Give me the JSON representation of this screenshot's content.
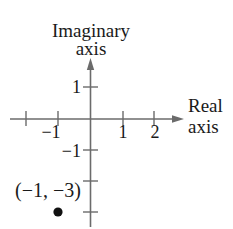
{
  "diagram": {
    "type": "complex-plane",
    "axes": {
      "imaginary_label_line1": "Imaginary",
      "imaginary_label_line2": "axis",
      "real_label_line1": "Real",
      "real_label_line2": "axis"
    },
    "x_ticks": [
      {
        "value": -2,
        "label": ""
      },
      {
        "value": -1,
        "label": "−1"
      },
      {
        "value": 1,
        "label": "1"
      },
      {
        "value": 2,
        "label": "2"
      }
    ],
    "y_ticks": [
      {
        "value": 1,
        "label": "1"
      },
      {
        "value": -1,
        "label": "−1"
      },
      {
        "value": -2,
        "label": ""
      },
      {
        "value": -3,
        "label": ""
      }
    ],
    "tick_labels": {
      "x_neg1": "−1",
      "x_1": "1",
      "x_2": "2",
      "y_1": "1",
      "y_neg1": "−1"
    },
    "point": {
      "x": -1,
      "y": -3,
      "label": "(−1, −3)"
    },
    "colors": {
      "axis": "#6b6b6b",
      "text": "#1a1a1a",
      "point": "#111111"
    }
  }
}
